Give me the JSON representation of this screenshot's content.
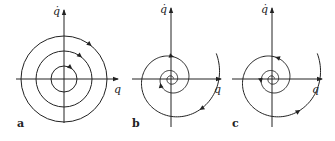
{
  "figure": {
    "panels": [
      {
        "id": "a",
        "label": "a",
        "kind": "center",
        "description": "concentric closed orbits (center)",
        "x_axis_label": "q",
        "y_axis_label": "q̇",
        "origin": [
          64,
          79
        ],
        "circle_radii": [
          13,
          28,
          43
        ],
        "direction": "clockwise"
      },
      {
        "id": "b",
        "label": "b",
        "kind": "stable-focus",
        "description": "spiral trajectory converging to origin",
        "x_axis_label": "q",
        "y_axis_label": "q̇",
        "origin": [
          171,
          79
        ],
        "direction": "clockwise-inward"
      },
      {
        "id": "c",
        "label": "c",
        "kind": "unstable-focus",
        "description": "spiral trajectory diverging from origin",
        "x_axis_label": "q",
        "y_axis_label": "q̇",
        "origin": [
          272,
          79
        ],
        "direction": "counterclockwise-outward"
      }
    ],
    "stroke_color": "#222222",
    "background": "#ffffff"
  }
}
